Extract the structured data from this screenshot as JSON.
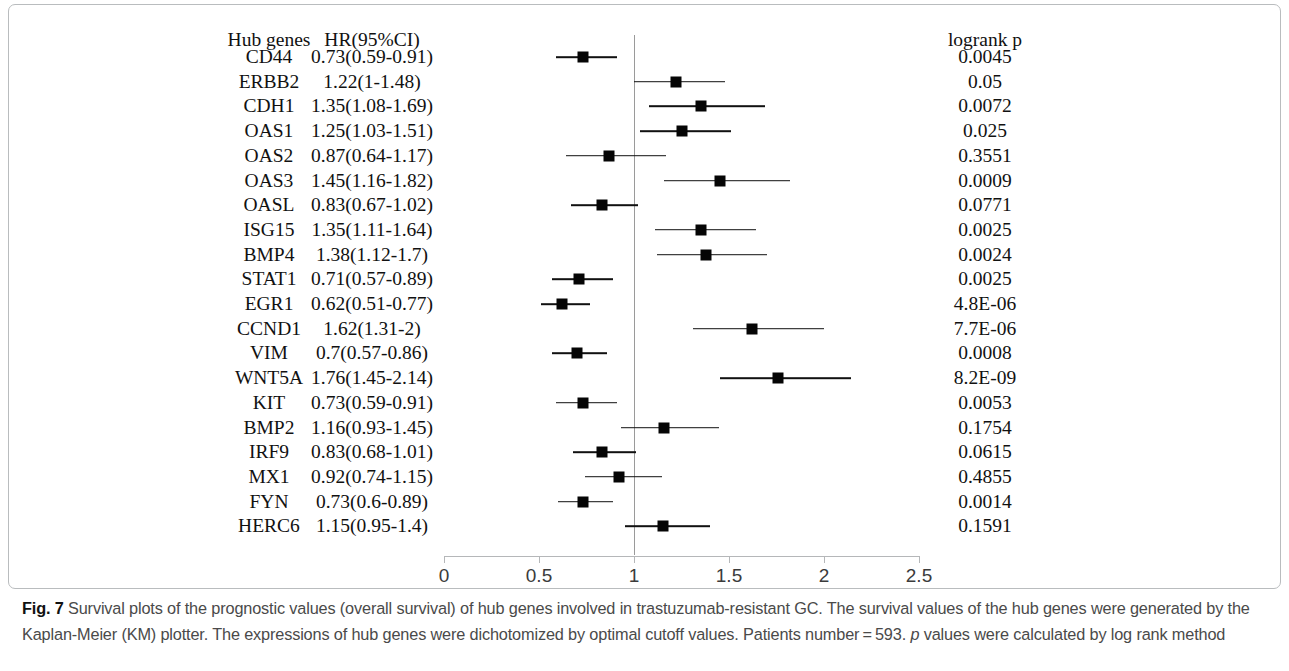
{
  "figure": {
    "columns": {
      "gene_header": "Hub genes",
      "hr_header": "HR(95%CI)",
      "p_header": "logrank p"
    },
    "axis": {
      "ticks": [
        "0",
        "0.5",
        "1",
        "1.5",
        "2",
        "2.5"
      ],
      "min": 0,
      "max": 2.5,
      "reference": 1
    },
    "caption_prefix": "Fig. 7",
    "caption_part1": " Survival plots of the prognostic values (overall survival) of hub genes involved in trastuzumab-resistant GC. The survival values of the hub genes were generated by the Kaplan-Meier (KM) plotter. The expressions of hub genes were dichotomized by optimal cutoff values. Patients number = 593. ",
    "caption_italic": "p",
    "caption_part2": " values were calculated by log rank method"
  },
  "chart_data": {
    "type": "forest",
    "title": "",
    "xlabel": "",
    "ylabel": "",
    "xlim": [
      0,
      2.5
    ],
    "reference_line": 1,
    "grid": false,
    "columns": [
      "Hub genes",
      "HR(95%CI)",
      "logrank p"
    ],
    "categories": [
      "CD44",
      "ERBB2",
      "CDH1",
      "OAS1",
      "OAS2",
      "OAS3",
      "OASL",
      "ISG15",
      "BMP4",
      "STAT1",
      "EGR1",
      "CCND1",
      "VIM",
      "WNT5A",
      "KIT",
      "BMP2",
      "IRF9",
      "MX1",
      "FYN",
      "HERC6"
    ],
    "rows": [
      {
        "gene": "CD44",
        "hr": 0.73,
        "low": 0.59,
        "high": 0.91,
        "hr_text": "0.73(0.59-0.91)",
        "p": "0.0045"
      },
      {
        "gene": "ERBB2",
        "hr": 1.22,
        "low": 1.0,
        "high": 1.48,
        "hr_text": "1.22(1-1.48)",
        "p": "0.05"
      },
      {
        "gene": "CDH1",
        "hr": 1.35,
        "low": 1.08,
        "high": 1.69,
        "hr_text": "1.35(1.08-1.69)",
        "p": "0.0072"
      },
      {
        "gene": "OAS1",
        "hr": 1.25,
        "low": 1.03,
        "high": 1.51,
        "hr_text": "1.25(1.03-1.51)",
        "p": "0.025"
      },
      {
        "gene": "OAS2",
        "hr": 0.87,
        "low": 0.64,
        "high": 1.17,
        "hr_text": "0.87(0.64-1.17)",
        "p": "0.3551"
      },
      {
        "gene": "OAS3",
        "hr": 1.45,
        "low": 1.16,
        "high": 1.82,
        "hr_text": "1.45(1.16-1.82)",
        "p": "0.0009"
      },
      {
        "gene": "OASL",
        "hr": 0.83,
        "low": 0.67,
        "high": 1.02,
        "hr_text": "0.83(0.67-1.02)",
        "p": "0.0771"
      },
      {
        "gene": "ISG15",
        "hr": 1.35,
        "low": 1.11,
        "high": 1.64,
        "hr_text": "1.35(1.11-1.64)",
        "p": "0.0025"
      },
      {
        "gene": "BMP4",
        "hr": 1.38,
        "low": 1.12,
        "high": 1.7,
        "hr_text": "1.38(1.12-1.7)",
        "p": "0.0024"
      },
      {
        "gene": "STAT1",
        "hr": 0.71,
        "low": 0.57,
        "high": 0.89,
        "hr_text": "0.71(0.57-0.89)",
        "p": "0.0025"
      },
      {
        "gene": "EGR1",
        "hr": 0.62,
        "low": 0.51,
        "high": 0.77,
        "hr_text": "0.62(0.51-0.77)",
        "p": "4.8E-06"
      },
      {
        "gene": "CCND1",
        "hr": 1.62,
        "low": 1.31,
        "high": 2.0,
        "hr_text": "1.62(1.31-2)",
        "p": "7.7E-06"
      },
      {
        "gene": "VIM",
        "hr": 0.7,
        "low": 0.57,
        "high": 0.86,
        "hr_text": "0.7(0.57-0.86)",
        "p": "0.0008"
      },
      {
        "gene": "WNT5A",
        "hr": 1.76,
        "low": 1.45,
        "high": 2.14,
        "hr_text": "1.76(1.45-2.14)",
        "p": "8.2E-09"
      },
      {
        "gene": "KIT",
        "hr": 0.73,
        "low": 0.59,
        "high": 0.91,
        "hr_text": "0.73(0.59-0.91)",
        "p": "0.0053"
      },
      {
        "gene": "BMP2",
        "hr": 1.16,
        "low": 0.93,
        "high": 1.45,
        "hr_text": "1.16(0.93-1.45)",
        "p": "0.1754"
      },
      {
        "gene": "IRF9",
        "hr": 0.83,
        "low": 0.68,
        "high": 1.01,
        "hr_text": "0.83(0.68-1.01)",
        "p": "0.0615"
      },
      {
        "gene": "MX1",
        "hr": 0.92,
        "low": 0.74,
        "high": 1.15,
        "hr_text": "0.92(0.74-1.15)",
        "p": "0.4855"
      },
      {
        "gene": "FYN",
        "hr": 0.73,
        "low": 0.6,
        "high": 0.89,
        "hr_text": "0.73(0.6-0.89)",
        "p": "0.0014"
      },
      {
        "gene": "HERC6",
        "hr": 1.15,
        "low": 0.95,
        "high": 1.4,
        "hr_text": "1.15(0.95-1.4)",
        "p": "0.1591"
      }
    ]
  }
}
